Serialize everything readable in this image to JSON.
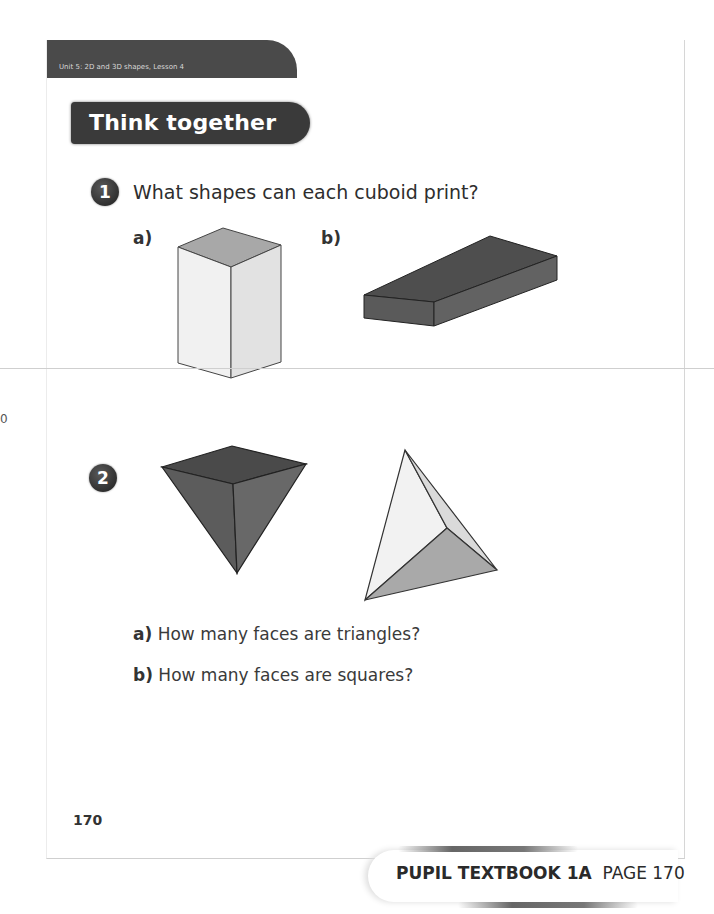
{
  "header": {
    "unit_label": "Unit 5: 2D and 3D shapes, Lesson 4",
    "section_title": "Think together"
  },
  "questions": [
    {
      "number": "1",
      "text": "What shapes can each cuboid print?",
      "parts": [
        {
          "label": "a)",
          "figure": "tall cuboid (light grey, square top)"
        },
        {
          "label": "b)",
          "figure": "flat cuboid (dark grey)"
        }
      ]
    },
    {
      "number": "2",
      "figures": [
        "square-based pyramid (inverted, dark grey)",
        "triangular pyramid / tetrahedron (light grey)"
      ],
      "parts": [
        {
          "label": "a)",
          "text": "How many faces are triangles?"
        },
        {
          "label": "b)",
          "text": "How many faces are squares?"
        }
      ]
    }
  ],
  "page_number": "170",
  "footer": {
    "book": "PUPIL TEXTBOOK 1A",
    "page": "PAGE 170"
  },
  "edge_mark": "0"
}
